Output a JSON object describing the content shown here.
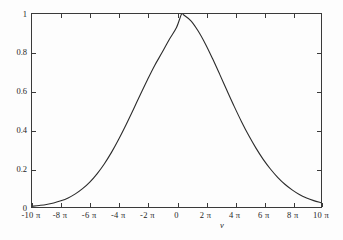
{
  "chart_data": {
    "type": "line",
    "title": "",
    "subtitle": "",
    "xlabel": "ν",
    "ylabel": "",
    "xlim": [
      -31.4159265,
      31.4159265
    ],
    "ylim": [
      0,
      1.0
    ],
    "xlim_units": "π",
    "xlim_in_pi": [
      -10,
      10
    ],
    "grid": false,
    "legend": null,
    "legend_position": "none",
    "x_tick_labels": [
      "-10 π",
      "-8 π",
      "-6 π",
      "-4 π",
      "-2 π",
      "0",
      "2 π",
      "4 π",
      "6 π",
      "8 π",
      "10 π"
    ],
    "x_tick_values_in_pi": [
      -10,
      -8,
      -6,
      -4,
      -2,
      0,
      2,
      4,
      6,
      8,
      10
    ],
    "y_tick_labels": [
      "0",
      "0.2",
      "0.4",
      "0.6",
      "0.8",
      "1"
    ],
    "y_tick_values": [
      0,
      0.2,
      0.4,
      0.6,
      0.8,
      1
    ],
    "series": [
      {
        "name": "lineshape",
        "color": "#2b2b2b",
        "line_width": 1.1,
        "peak_x_in_pi": 0.35,
        "peak_y": 1.0,
        "fwhm_in_pi": 6.2,
        "x_in_pi": [
          -10,
          -9.5,
          -9,
          -8.5,
          -8,
          -7.5,
          -7,
          -6.5,
          -6,
          -5.5,
          -5,
          -4.5,
          -4,
          -3.5,
          -3,
          -2.5,
          -2,
          -1.5,
          -1,
          -0.5,
          0,
          0.35,
          0.5,
          1,
          1.5,
          2,
          2.5,
          3,
          3.5,
          4,
          4.5,
          5,
          5.5,
          6,
          6.5,
          7,
          7.5,
          8,
          8.5,
          9,
          9.5,
          10
        ],
        "values": [
          0.004,
          0.008,
          0.013,
          0.021,
          0.032,
          0.047,
          0.068,
          0.095,
          0.129,
          0.172,
          0.223,
          0.283,
          0.351,
          0.425,
          0.503,
          0.583,
          0.661,
          0.735,
          0.8,
          0.868,
          0.93,
          1.0,
          0.995,
          0.965,
          0.912,
          0.845,
          0.768,
          0.686,
          0.602,
          0.52,
          0.442,
          0.37,
          0.305,
          0.247,
          0.197,
          0.154,
          0.118,
          0.089,
          0.065,
          0.047,
          0.033,
          0.022
        ]
      }
    ]
  },
  "axes": {
    "frame_color": "#3a3a3a",
    "background": "#ffffff",
    "tick_direction": "in",
    "ticks_on_all_sides": true
  }
}
